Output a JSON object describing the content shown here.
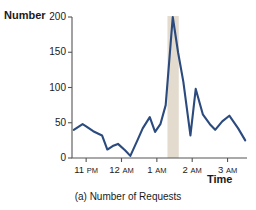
{
  "figure": {
    "caption": "(a) Number of Requests",
    "ylabel": "Number",
    "xlabel": "Time"
  },
  "colors": {
    "line": "#2b4a7d",
    "axis": "#555555",
    "band": "#e3dbce",
    "text": "#1a1a1a"
  },
  "chart_data": {
    "type": "line",
    "title": "(a) Number of Requests",
    "xlabel": "Time",
    "ylabel": "Number",
    "ylim": [
      0,
      200
    ],
    "yticks": [
      0,
      50,
      100,
      150,
      200
    ],
    "ytick_labels": [
      "0",
      "50",
      "100",
      "150",
      "200"
    ],
    "xticks": [
      "11 PM",
      "12 AM",
      "1 AM",
      "2 AM",
      "3 AM"
    ],
    "xtick_hours": [
      "11",
      "12",
      "1",
      "2",
      "3"
    ],
    "xtick_meridiems": [
      "PM",
      "AM",
      "AM",
      "AM",
      "AM"
    ],
    "xlim_hours": [
      22.6,
      27.55
    ],
    "grid": false,
    "legend": false,
    "highlight_band": {
      "label": "attack interval",
      "x_start_hour": 25.3,
      "x_end_hour": 25.62,
      "color": "#e3dbce"
    },
    "series": [
      {
        "name": "Number of Requests",
        "color": "#2b4a7d",
        "x": [
          22.65,
          22.9,
          23.0,
          23.2,
          23.45,
          23.6,
          23.75,
          23.9,
          24.1,
          24.25,
          24.45,
          24.6,
          24.8,
          24.95,
          25.1,
          25.25,
          25.45,
          25.6,
          25.75,
          25.95,
          26.1,
          26.3,
          26.5,
          26.65,
          26.85,
          27.05,
          27.3,
          27.5
        ],
        "y": [
          40,
          48,
          45,
          38,
          32,
          12,
          17,
          20,
          11,
          3,
          25,
          42,
          58,
          37,
          48,
          75,
          200,
          150,
          108,
          32,
          98,
          62,
          48,
          40,
          52,
          60,
          42,
          25
        ]
      }
    ]
  }
}
